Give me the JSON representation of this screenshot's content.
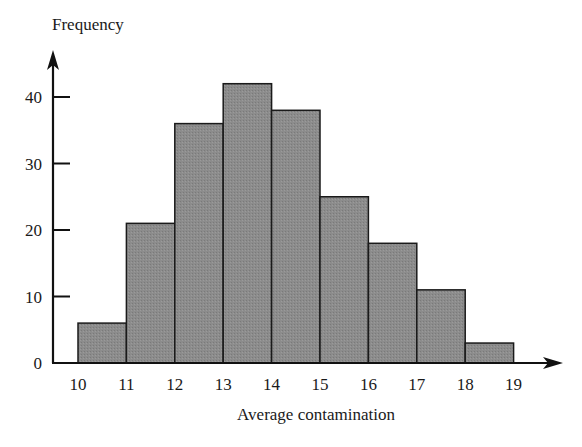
{
  "chart_data": {
    "type": "bar",
    "title": "",
    "xlabel": "Average contamination",
    "ylabel": "Frequency",
    "bin_edges": [
      10,
      11,
      12,
      13,
      14,
      15,
      16,
      17,
      18,
      19
    ],
    "categories": [
      "10-11",
      "11-12",
      "12-13",
      "13-14",
      "14-15",
      "15-16",
      "16-17",
      "17-18",
      "18-19"
    ],
    "values": [
      6,
      21,
      36,
      42,
      38,
      25,
      18,
      11,
      3
    ],
    "x_ticks": [
      10,
      11,
      12,
      13,
      14,
      15,
      16,
      17,
      18,
      19
    ],
    "y_ticks": [
      0,
      10,
      20,
      30,
      40
    ],
    "ylim": [
      0,
      45
    ],
    "grid": false,
    "legend": null,
    "bar_color": "#8a8a8a",
    "edge_color": "#1a1a1a"
  }
}
